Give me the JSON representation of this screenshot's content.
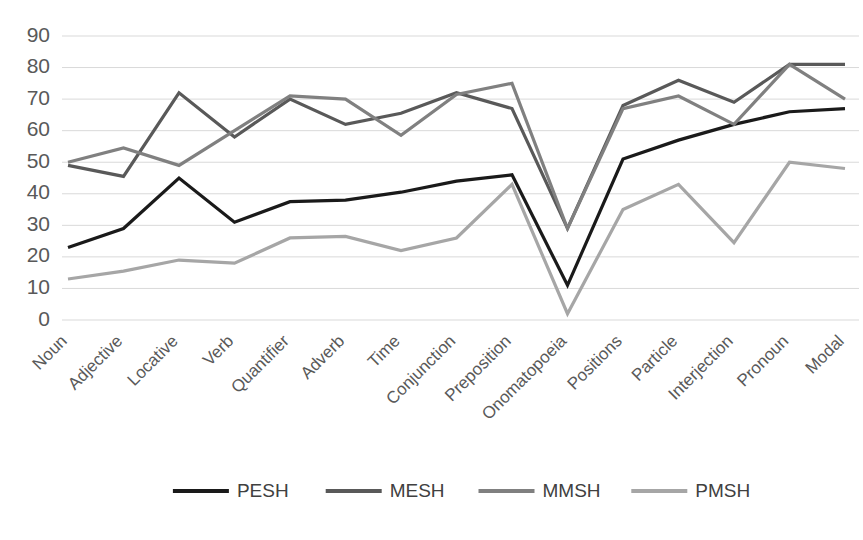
{
  "chart_data": {
    "type": "line",
    "title": "",
    "xlabel": "",
    "ylabel": "",
    "ylim": [
      0,
      90
    ],
    "ytick_step": 10,
    "grid": true,
    "legend_position": "bottom",
    "yticks": [
      "0",
      "10",
      "20",
      "30",
      "40",
      "50",
      "60",
      "70",
      "80",
      "90"
    ],
    "categories": [
      "Noun",
      "Adjective",
      "Locative",
      "Verb",
      "Quantifier",
      "Adverb",
      "Time",
      "Conjunction",
      "Preposition",
      "Onomatopoeia",
      "Positions",
      "Particle",
      "Interjection",
      "Pronoun",
      "Modal"
    ],
    "series": [
      {
        "name": "PESH",
        "color": "#1a1a1a",
        "values": [
          23,
          29,
          45,
          31,
          37.5,
          38,
          40.5,
          44,
          46,
          11,
          51,
          57,
          62,
          66,
          67
        ]
      },
      {
        "name": "MESH",
        "color": "#595959",
        "values": [
          49,
          45.5,
          72,
          58,
          70,
          62,
          65.5,
          72,
          67,
          29,
          68,
          76,
          69,
          81,
          81
        ]
      },
      {
        "name": "MMSH",
        "color": "#808080",
        "values": [
          50,
          54.5,
          49,
          60,
          71,
          70,
          58.5,
          71.5,
          75,
          29,
          67,
          71,
          62,
          81,
          70
        ]
      },
      {
        "name": "PMSH",
        "color": "#a6a6a6",
        "values": [
          13,
          15.5,
          19,
          18,
          26,
          26.5,
          22,
          26,
          43,
          2,
          35,
          43,
          24.5,
          50,
          48
        ]
      }
    ]
  },
  "legend": {
    "items": [
      {
        "label": "PESH",
        "color": "#1a1a1a"
      },
      {
        "label": "MESH",
        "color": "#595959"
      },
      {
        "label": "MMSH",
        "color": "#808080"
      },
      {
        "label": "PMSH",
        "color": "#a6a6a6"
      }
    ]
  }
}
